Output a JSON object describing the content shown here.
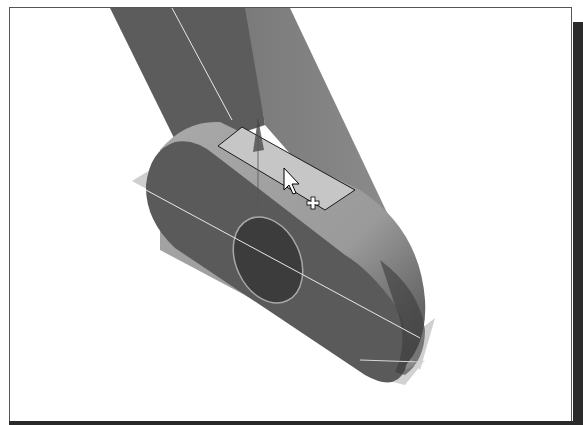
{
  "viewport": {
    "type": "3d-model-viewport",
    "background": "#ffffff",
    "model": {
      "name": "link-arm",
      "colors": {
        "body_dark": "#5a5a5a",
        "body_mid": "#6e6e6e",
        "body_light": "#8a8a8a",
        "top_face": "#a8a8a8",
        "selected_face": "#c4c4c4",
        "hole": "#3e3e3e",
        "edge_line": "#e6e6e6",
        "plane": "#c8c8c8"
      }
    },
    "selection": {
      "face_highlighted": true,
      "cursor": "pointer-with-plus"
    }
  }
}
